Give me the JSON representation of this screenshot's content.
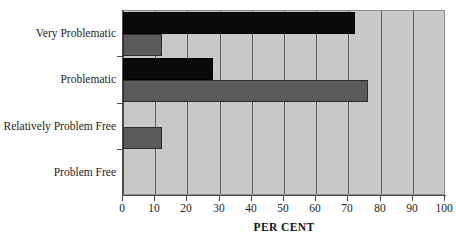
{
  "chart_data": {
    "type": "bar",
    "orientation": "horizontal",
    "title": "",
    "xlabel": "PER CENT",
    "ylabel": "",
    "xlim": [
      0,
      100
    ],
    "xticks": [
      0,
      10,
      20,
      30,
      40,
      50,
      60,
      70,
      80,
      90,
      100
    ],
    "xtick_labels": [
      "0",
      "10",
      "20",
      "30",
      "40",
      "50",
      "60",
      "70",
      "80",
      "90",
      "100"
    ],
    "grid": true,
    "grid_axis": "x",
    "legend": false,
    "legend_position": "none",
    "categories": [
      "Very Problematic",
      "Problematic",
      "Relatively Problem Free",
      "Problem Free"
    ],
    "series": [
      {
        "name": "Series 1",
        "color": "#0a0a0a",
        "values": [
          72,
          28,
          0,
          0
        ]
      },
      {
        "name": "Series 2",
        "color": "#5a5a5a",
        "values": [
          12,
          76,
          12,
          0
        ]
      }
    ],
    "plot_background": "#c8c8c8",
    "gridline_color": "#5c5c5c",
    "axis_color": "#4a4a4a"
  },
  "axes": {
    "y_labels": [
      "Very Problematic",
      "Problematic",
      "Relatively Problem Free",
      "Problem Free"
    ],
    "x_tick_labels": [
      "0",
      "10",
      "20",
      "30",
      "40",
      "50",
      "60",
      "70",
      "80",
      "90",
      "100"
    ],
    "x_axis_title": "PER CENT"
  }
}
